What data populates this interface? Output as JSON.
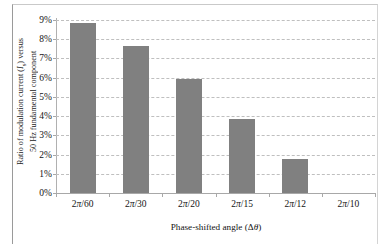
{
  "chart_data": {
    "type": "bar",
    "title": "",
    "subtitle": "",
    "categories": [
      "2π/60",
      "2π/30",
      "2π/20",
      "2π/15",
      "2π/12",
      "2π/10"
    ],
    "values": [
      8.85,
      7.65,
      5.95,
      3.85,
      1.75,
      0
    ],
    "value_unit": "%",
    "xlabel_prefix": "Phase-shifted angle (Δ",
    "xlabel_var": "θ",
    "xlabel_suffix": ")",
    "xlabel": "Phase-shifted angle (Δθ)",
    "ylabel_line1_pre": "Ratio of modulation current (",
    "ylabel_line1_var": "I",
    "ylabel_line1_sub": "s",
    "ylabel_line1_post": ") versus",
    "ylabel_line2": "50 Hz fundamental component",
    "ylabel": "Ratio of modulation current (Is) versus 50 Hz fundamental component",
    "ylim": [
      0,
      9
    ],
    "ytick_labels": [
      "9%",
      "8%",
      "7%",
      "6%",
      "5%",
      "4%",
      "3%",
      "2%",
      "1%",
      "0%"
    ],
    "ytick_values": [
      9,
      8,
      7,
      6,
      5,
      4,
      3,
      2,
      1,
      0
    ],
    "grid": true,
    "grid_style": "dashed",
    "legend": "none",
    "bar_color": "#808080",
    "grid_color": "#bfbfbf",
    "axis_color": "#a8a8a8",
    "background": "#ffffff"
  }
}
